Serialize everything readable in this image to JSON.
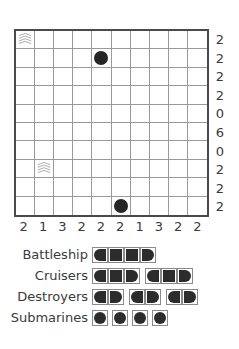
{
  "puzzle": {
    "grid_size": 10,
    "row_clues": [
      "2",
      "2",
      "2",
      "2",
      "0",
      "6",
      "0",
      "2",
      "2",
      "2"
    ],
    "col_clues": [
      "2",
      "1",
      "3",
      "2",
      "2",
      "2",
      "1",
      "3",
      "2",
      "2"
    ],
    "given": [
      {
        "row": 0,
        "col": 0,
        "type": "water"
      },
      {
        "row": 1,
        "col": 4,
        "type": "submarine"
      },
      {
        "row": 7,
        "col": 1,
        "type": "water"
      },
      {
        "row": 9,
        "col": 5,
        "type": "submarine"
      }
    ]
  },
  "fleet": {
    "rows": [
      {
        "label": "Battleship",
        "count": 1,
        "length": 4
      },
      {
        "label": "Cruisers",
        "count": 2,
        "length": 3
      },
      {
        "label": "Destroyers",
        "count": 3,
        "length": 2
      },
      {
        "label": "Submarines",
        "count": 4,
        "length": 1
      }
    ]
  }
}
